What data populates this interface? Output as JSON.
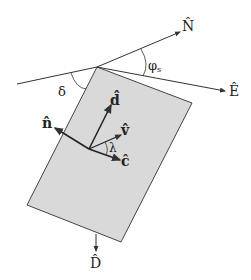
{
  "diagram": {
    "colors": {
      "plane_fill": "#d9d9d9",
      "plane_stroke": "#444444",
      "line": "#333333",
      "text": "#222222"
    },
    "labels": {
      "north": "N̂",
      "east": "Ê",
      "down": "D̂",
      "dip_angle": "δ",
      "strike_angle": "φ",
      "strike_angle_sub": "s",
      "dip_vector": "d̂",
      "normal_vector": "n̂",
      "slip_vector": "v̂",
      "strike_vector": "ĉ",
      "rake_angle": "λ"
    }
  }
}
